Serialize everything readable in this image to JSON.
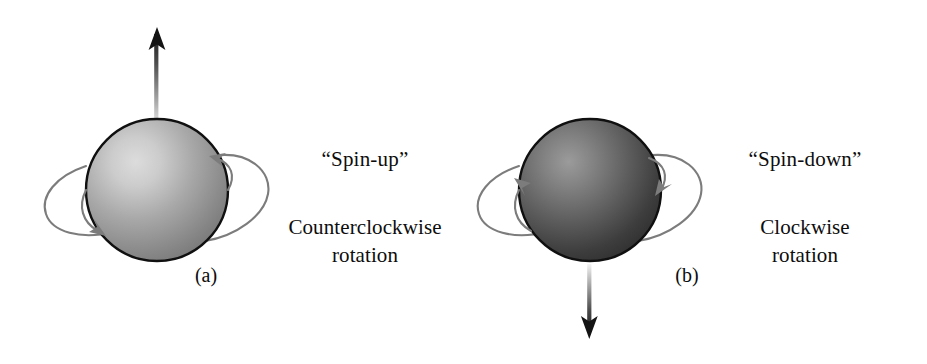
{
  "figure": {
    "background_color": "#ffffff",
    "panels": [
      {
        "id": "a",
        "letter": "(a)",
        "spin_label": "“Spin-up”",
        "rotation_line1": "Counterclockwise",
        "rotation_line2": "rotation",
        "sphere": {
          "center_x": 157,
          "center_y": 190,
          "radius": 71,
          "highlight_color": "#d2d2d2",
          "mid_color": "#9a9a9a",
          "edge_color": "#6e6e6e",
          "outline_color": "#111111"
        },
        "spin_arrow": {
          "direction": "up",
          "tip_x": 157,
          "tip_y": 28,
          "tail_y": 120,
          "color": "#1a1a1a"
        },
        "rotation_arrows": {
          "sense": "counterclockwise",
          "color": "#7c7c7c"
        }
      },
      {
        "id": "b",
        "letter": "(b)",
        "spin_label": "“Spin-down”",
        "rotation_line1": "Clockwise",
        "rotation_line2": "rotation",
        "sphere": {
          "center_x": 590,
          "center_y": 190,
          "radius": 71,
          "highlight_color": "#8e8e8e",
          "mid_color": "#555555",
          "edge_color": "#323232",
          "outline_color": "#111111"
        },
        "spin_arrow": {
          "direction": "down",
          "tip_x": 590,
          "tip_y": 338,
          "tail_y": 262,
          "color": "#1a1a1a"
        },
        "rotation_arrows": {
          "sense": "clockwise",
          "color": "#7c7c7c"
        }
      }
    ]
  }
}
